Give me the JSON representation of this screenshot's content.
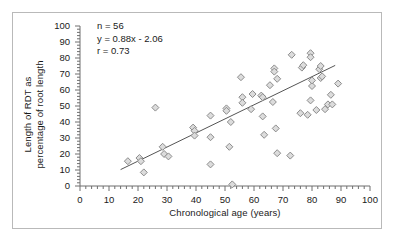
{
  "figure": {
    "frame_color": "#b9b9b9",
    "background": "#ffffff"
  },
  "annotation": {
    "n": "n = 56",
    "equation": "y = 0.88x - 2.06",
    "correlation": "r = 0.73"
  },
  "chart_data": {
    "type": "scatter",
    "title": "",
    "xlabel": "Chronological age (years)",
    "ylabel": "Length of RDT as percentage of root length",
    "ylabel_line1": "Length of RDT as",
    "ylabel_line2": "percentage of root length",
    "xlim": [
      0,
      100
    ],
    "ylim": [
      0,
      100
    ],
    "xticks": [
      0,
      10,
      20,
      30,
      40,
      50,
      60,
      70,
      80,
      90,
      100
    ],
    "yticks": [
      0,
      10,
      20,
      30,
      40,
      50,
      60,
      70,
      80,
      90,
      100
    ],
    "x_minor_tick_step": 2,
    "y_minor_tick_step": 2,
    "grid": false,
    "legend": null,
    "marker": {
      "shape": "diamond",
      "fill": "#dcdcdc",
      "edge": "#8c8c8c",
      "size": 7
    },
    "n_points": 56,
    "points": [
      [
        16.5,
        15.5
      ],
      [
        20.5,
        17.5
      ],
      [
        21.0,
        15.5
      ],
      [
        22.0,
        8.5
      ],
      [
        26.0,
        49.0
      ],
      [
        28.5,
        24.5
      ],
      [
        29.0,
        20.0
      ],
      [
        30.5,
        18.5
      ],
      [
        39.0,
        36.5
      ],
      [
        39.5,
        34.5
      ],
      [
        39.5,
        31.5
      ],
      [
        45.0,
        44.0
      ],
      [
        45.0,
        30.5
      ],
      [
        45.0,
        13.5
      ],
      [
        50.5,
        48.5
      ],
      [
        50.5,
        47.0
      ],
      [
        51.5,
        24.5
      ],
      [
        52.0,
        40.0
      ],
      [
        52.5,
        1.0
      ],
      [
        55.5,
        68.0
      ],
      [
        56.0,
        55.5
      ],
      [
        56.0,
        52.0
      ],
      [
        59.0,
        48.0
      ],
      [
        59.5,
        57.5
      ],
      [
        62.5,
        56.5
      ],
      [
        63.0,
        55.5
      ],
      [
        63.0,
        43.5
      ],
      [
        63.5,
        32.0
      ],
      [
        65.5,
        63.0
      ],
      [
        66.5,
        52.5
      ],
      [
        67.0,
        73.5
      ],
      [
        67.0,
        71.5
      ],
      [
        67.5,
        36.0
      ],
      [
        68.0,
        67.0
      ],
      [
        68.0,
        20.5
      ],
      [
        72.5,
        19.0
      ],
      [
        73.0,
        82.0
      ],
      [
        76.0,
        45.5
      ],
      [
        76.5,
        74.0
      ],
      [
        77.0,
        75.5
      ],
      [
        78.5,
        44.5
      ],
      [
        79.5,
        83.0
      ],
      [
        79.5,
        80.5
      ],
      [
        79.5,
        53.5
      ],
      [
        80.0,
        62.5
      ],
      [
        80.0,
        66.0
      ],
      [
        81.5,
        47.5
      ],
      [
        82.5,
        73.0
      ],
      [
        83.0,
        75.0
      ],
      [
        83.0,
        67.5
      ],
      [
        83.5,
        68.5
      ],
      [
        84.5,
        48.0
      ],
      [
        85.5,
        51.0
      ],
      [
        86.5,
        57.0
      ],
      [
        87.0,
        51.0
      ],
      [
        89.0,
        64.0
      ]
    ],
    "trendline": {
      "slope": 0.88,
      "intercept": -2.06,
      "x_start": 14.0,
      "x_end": 88.0,
      "color": "#555555"
    }
  }
}
